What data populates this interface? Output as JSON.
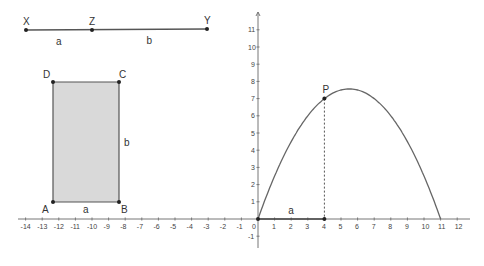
{
  "segment": {
    "points": [
      {
        "name": "X",
        "x": 26,
        "y": 30
      },
      {
        "name": "Z",
        "x": 92,
        "y": 30
      },
      {
        "name": "Y",
        "x": 207,
        "y": 29
      }
    ],
    "labels": {
      "a": "a",
      "b": "b"
    }
  },
  "rectangle": {
    "vertices": {
      "A": {
        "label": "A",
        "x": 53,
        "y": 202
      },
      "B": {
        "label": "B",
        "x": 119,
        "y": 202
      },
      "C": {
        "label": "C",
        "x": 119,
        "y": 82
      },
      "D": {
        "label": "D",
        "x": 53,
        "y": 82
      }
    },
    "side_labels": {
      "bottom": "a",
      "right": "b"
    },
    "fill": "#d9d9d9"
  },
  "axes": {
    "origin_px": {
      "x": 258,
      "y": 219
    },
    "x_unit_px": 16.6,
    "y_unit_px": 17.2,
    "x_ticks": [
      "-14",
      "-13",
      "-12",
      "-11",
      "-10",
      "-9",
      "-8",
      "-7",
      "-6",
      "-5",
      "-4",
      "-3",
      "-2",
      "-1",
      "0",
      "1",
      "2",
      "3",
      "4",
      "5",
      "6",
      "7",
      "8",
      "9",
      "10",
      "11",
      "12"
    ],
    "y_ticks": [
      "-1",
      "1",
      "2",
      "3",
      "4",
      "5",
      "6",
      "7",
      "8",
      "9",
      "10",
      "11"
    ]
  },
  "graph": {
    "function": "f(x) = x(11 - x) / 4",
    "domain": [
      0,
      11
    ],
    "point_P": {
      "label": "P",
      "x": 4,
      "y": 7
    },
    "segment_label": "a"
  },
  "colors": {
    "line": "#555555",
    "curve": "#666666",
    "point": "#222222"
  }
}
